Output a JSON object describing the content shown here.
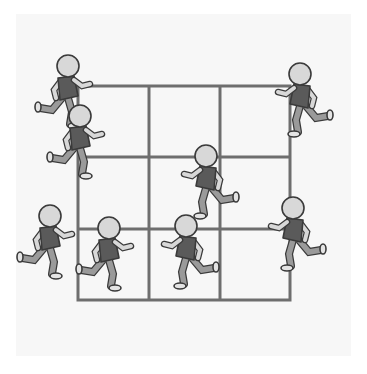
{
  "illustration": {
    "description": "3x3 grid with eight cartoon children running around it",
    "colors": {
      "background": "#f7f7f7",
      "grid_line": "#6e6e6e",
      "outline": "#3a3a3a",
      "skin": "#d8d8d8",
      "shirt": "#5a5a5a",
      "pants": "#9a9a9a",
      "shoe": "#e4e4e4"
    },
    "grid": {
      "rows": 3,
      "cols": 3,
      "left": 78,
      "top": 86,
      "right": 290,
      "bottom": 300,
      "v_lines": [
        149,
        220
      ],
      "h_lines": [
        157,
        229
      ]
    },
    "figures": [
      {
        "id": "runner-1",
        "x": 66,
        "y": 70,
        "facing": "right"
      },
      {
        "id": "runner-2",
        "x": 78,
        "y": 120,
        "facing": "right"
      },
      {
        "id": "runner-3",
        "x": 302,
        "y": 78,
        "facing": "left"
      },
      {
        "id": "runner-4",
        "x": 208,
        "y": 160,
        "facing": "left"
      },
      {
        "id": "runner-5",
        "x": 48,
        "y": 220,
        "facing": "right"
      },
      {
        "id": "runner-6",
        "x": 107,
        "y": 232,
        "facing": "right"
      },
      {
        "id": "runner-7",
        "x": 188,
        "y": 230,
        "facing": "left"
      },
      {
        "id": "runner-8",
        "x": 295,
        "y": 212,
        "facing": "left"
      }
    ]
  }
}
